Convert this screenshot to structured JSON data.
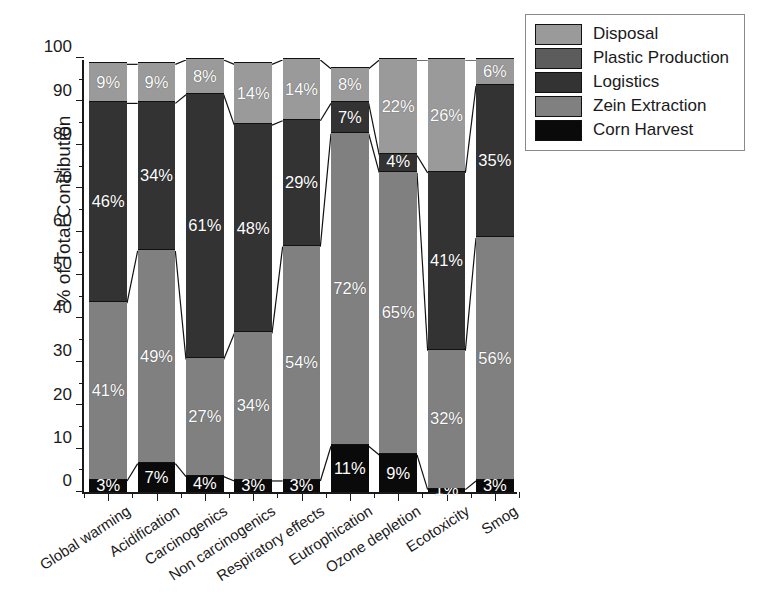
{
  "chart_data": {
    "type": "bar",
    "subtype": "stacked-100-percent",
    "title": "",
    "xlabel": "",
    "ylabel": "% of Total Contribution",
    "ylim": [
      0,
      100
    ],
    "ytick_step": 10,
    "yminor_step": 5,
    "ytick_labels": [
      "0",
      "10",
      "20",
      "30",
      "40",
      "50",
      "60",
      "70",
      "80",
      "90",
      "100"
    ],
    "grid": false,
    "legend_position": "top-right-outside",
    "categories": [
      "Global warming",
      "Acidification",
      "Carcinogenics",
      "Non carcinogenics",
      "Respiratory effects",
      "Eutrophication",
      "Ozone depletion",
      "Ecotoxicity",
      "Smog"
    ],
    "legend_order": [
      "Disposal",
      "Plastic Production",
      "Logistics",
      "Zein Extraction",
      "Corn Harvest"
    ],
    "stack_order_bottom_to_top": [
      "Corn Harvest",
      "Zein Extraction",
      "Logistics",
      "Disposal"
    ],
    "series": [
      {
        "name": "Corn Harvest",
        "color": "#0a0a0a",
        "values": [
          3,
          7,
          4,
          3,
          3,
          11,
          9,
          1,
          3
        ],
        "labels": [
          "3%",
          "7%",
          "4%",
          "3%",
          "3%",
          "11%",
          "9%",
          "1%",
          "3%"
        ]
      },
      {
        "name": "Zein Extraction",
        "color": "#808080",
        "values": [
          41,
          49,
          27,
          34,
          54,
          72,
          65,
          32,
          56
        ],
        "labels": [
          "41%",
          "49%",
          "27%",
          "34%",
          "54%",
          "72%",
          "65%",
          "32%",
          "56%"
        ]
      },
      {
        "name": "Logistics",
        "color": "#333333",
        "values": [
          46,
          34,
          61,
          48,
          29,
          7,
          4,
          41,
          35
        ],
        "labels": [
          "46%",
          "34%",
          "61%",
          "48%",
          "29%",
          "7%",
          "4%",
          "41%",
          "35%"
        ]
      },
      {
        "name": "Disposal",
        "color": "#9a9a9a",
        "values": [
          9,
          9,
          8,
          14,
          14,
          8,
          22,
          26,
          6
        ],
        "labels": [
          "9%",
          "9%",
          "8%",
          "14%",
          "14%",
          "8%",
          "22%",
          "26%",
          "6%"
        ]
      },
      {
        "name": "Plastic Production",
        "color": "#5c5c5c",
        "values": [
          0,
          0,
          0,
          0,
          0,
          0,
          0,
          0,
          0
        ],
        "labels": [
          "",
          "",
          "",
          "",
          "",
          "",
          "",
          "",
          ""
        ]
      }
    ]
  },
  "legend": {
    "items": [
      {
        "label": "Disposal",
        "color": "#9a9a9a"
      },
      {
        "label": "Plastic Production",
        "color": "#5c5c5c"
      },
      {
        "label": "Logistics",
        "color": "#333333"
      },
      {
        "label": "Zein Extraction",
        "color": "#808080"
      },
      {
        "label": "Corn Harvest",
        "color": "#0a0a0a"
      }
    ]
  },
  "axis": {
    "y_title": "% of Total Contribution"
  }
}
